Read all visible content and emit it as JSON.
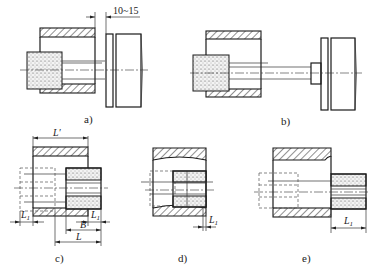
{
  "panels": [
    {
      "id": "a",
      "caption": "a)",
      "dimension": "10~15"
    },
    {
      "id": "b",
      "caption": "b)"
    },
    {
      "id": "c",
      "caption": "c)",
      "dimensions": {
        "L_prime": "L′",
        "L1_left": "L",
        "L1_left_sub": "1",
        "L1_right": "L",
        "L1_right_sub": "1",
        "B": "B",
        "L": "L"
      }
    },
    {
      "id": "d",
      "caption": "d)",
      "dimensions": {
        "L1": "L",
        "L1_sub": "1"
      }
    },
    {
      "id": "e",
      "caption": "e)",
      "dimensions": {
        "L1": "L",
        "L1_sub": "1"
      }
    }
  ],
  "colors": {
    "line": "#1a1a1a",
    "background": "#ffffff"
  }
}
